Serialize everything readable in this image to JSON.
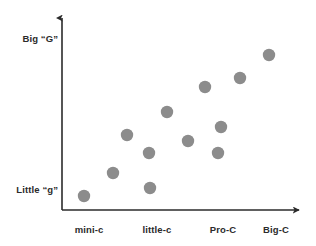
{
  "chart_data": {
    "type": "scatter",
    "title": "",
    "subtitle": "",
    "xlabel": "",
    "ylabel": "",
    "grid": false,
    "legend": null,
    "axis_style": "arrow",
    "marker": {
      "shape": "circle",
      "color": "#8c8c8c",
      "radius_px": 6.2
    },
    "x_categories": [
      "mini-c",
      "little-c",
      "Pro-C",
      "Big-C"
    ],
    "y_axis_labels": {
      "top": "Big “G”",
      "bottom": "Little “g”"
    },
    "xlim": [
      0,
      4.6
    ],
    "ylim": [
      0,
      1.12
    ],
    "points": [
      {
        "x_px": 84,
        "y_px": 196,
        "category": "mini-c",
        "x": 0.58,
        "y": 0.08
      },
      {
        "x_px": 113,
        "y_px": 173,
        "category": "mini-c",
        "x": 0.93,
        "y": 0.23
      },
      {
        "x_px": 127,
        "y_px": 135,
        "category": "mini-c",
        "x": 1.1,
        "y": 0.47
      },
      {
        "x_px": 150,
        "y_px": 188,
        "category": "little-c",
        "x": 1.38,
        "y": 0.13
      },
      {
        "x_px": 149,
        "y_px": 153,
        "category": "little-c",
        "x": 1.37,
        "y": 0.36
      },
      {
        "x_px": 167,
        "y_px": 112,
        "category": "little-c",
        "x": 1.59,
        "y": 0.62
      },
      {
        "x_px": 188,
        "y_px": 141,
        "category": "little-c",
        "x": 1.85,
        "y": 0.43
      },
      {
        "x_px": 205,
        "y_px": 87,
        "category": "Pro-C",
        "x": 2.05,
        "y": 0.78
      },
      {
        "x_px": 218,
        "y_px": 153,
        "category": "Pro-C",
        "x": 2.21,
        "y": 0.36
      },
      {
        "x_px": 221,
        "y_px": 127,
        "category": "Pro-C",
        "x": 2.24,
        "y": 0.52
      },
      {
        "x_px": 240,
        "y_px": 78,
        "category": "Pro-C",
        "x": 2.48,
        "y": 0.84
      },
      {
        "x_px": 269,
        "y_px": 55,
        "category": "Big-C",
        "x": 2.83,
        "y": 0.98
      }
    ],
    "x_tick_positions_px": [
      89,
      157,
      223,
      276
    ],
    "axes": {
      "y_axis_x_px": 62,
      "y_axis_top_px": 12,
      "x_axis_y_px": 210,
      "x_axis_right_px": 305,
      "color": "#2b2b2b",
      "width_px": 1.6
    }
  }
}
